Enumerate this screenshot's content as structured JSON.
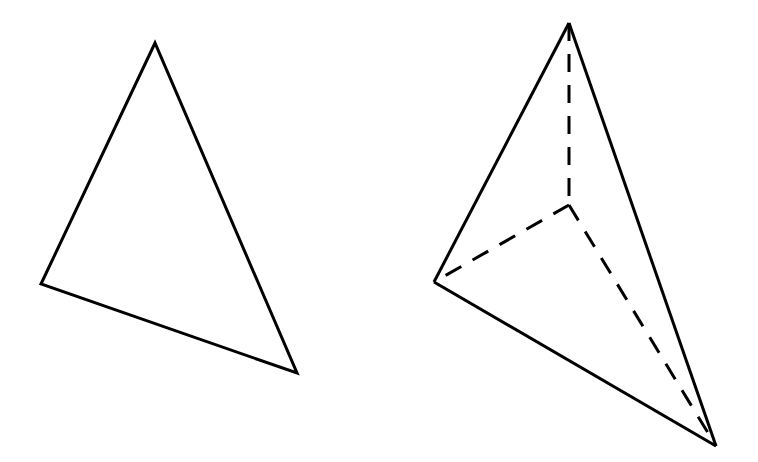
{
  "figures": {
    "triangle": {
      "name": "plane-triangle",
      "vertices": [
        [
          155,
          43
        ],
        [
          41,
          284
        ],
        [
          297,
          373
        ]
      ],
      "stroke_color": "#000000"
    },
    "tetrahedron": {
      "name": "triangular-pyramid",
      "visible_edges": [
        [
          [
            569,
            23
          ],
          [
            434,
            282
          ]
        ],
        [
          [
            434,
            282
          ],
          [
            716,
            446
          ]
        ],
        [
          [
            569,
            23
          ],
          [
            716,
            446
          ]
        ]
      ],
      "hidden_edges": [
        [
          [
            569,
            23
          ],
          [
            569,
            205
          ]
        ],
        [
          [
            569,
            205
          ],
          [
            434,
            282
          ]
        ],
        [
          [
            569,
            205
          ],
          [
            716,
            446
          ]
        ]
      ],
      "stroke_color": "#000000"
    }
  }
}
